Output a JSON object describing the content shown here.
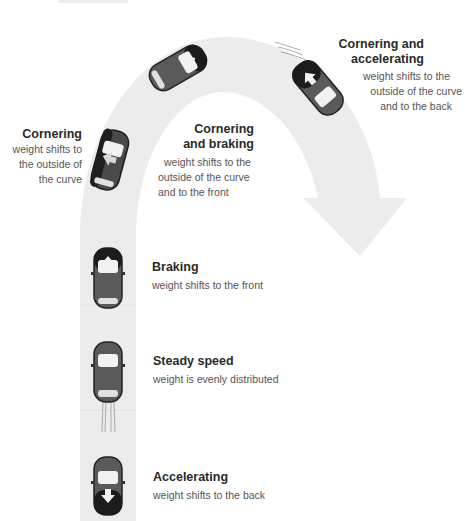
{
  "diagram": {
    "colors": {
      "road": "#ececec",
      "title_text": "#2a2a2a",
      "body_text": "#555555",
      "car_body": "#5a5a5a",
      "car_dark": "#1c1c1c",
      "car_glass": "#f2f2f2"
    },
    "states": [
      {
        "id": "cornering",
        "title": "Cornering",
        "lines": [
          "weight shifts to",
          "the outside of",
          "the curve"
        ]
      },
      {
        "id": "cornering-and-braking",
        "title_lines": [
          "Cornering",
          "and braking"
        ],
        "lines": [
          "weight shifts to the",
          "outside of the curve",
          "and to the front"
        ]
      },
      {
        "id": "cornering-and-accelerating",
        "title_lines": [
          "Cornering and",
          "accelerating"
        ],
        "lines": [
          "weight shifts to the",
          "outside of the curve",
          "and to the back"
        ]
      },
      {
        "id": "braking",
        "title": "Braking",
        "lines": [
          "weight shifts to the front"
        ]
      },
      {
        "id": "steady-speed",
        "title": "Steady speed",
        "lines": [
          "weight is evenly distributed"
        ]
      },
      {
        "id": "accelerating",
        "title": "Accelerating",
        "lines": [
          "weight shifts to the back"
        ]
      }
    ]
  }
}
